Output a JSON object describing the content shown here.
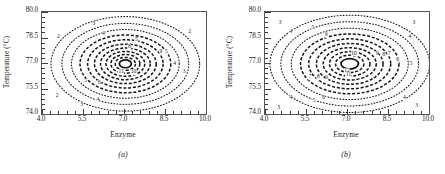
{
  "figure": {
    "panels": [
      {
        "id": "a",
        "caption": "(a)",
        "xlabel": "Enzyme",
        "ylabel": "Temperature (°C)",
        "xticks": [
          "4.0",
          "5.5",
          "7.0",
          "8.5",
          "10.0"
        ],
        "yticks": [
          "80.0",
          "78.5",
          "77.0",
          "75.5",
          "74.0"
        ]
      },
      {
        "id": "b",
        "caption": "(b)",
        "xlabel": "Enzyme",
        "ylabel": "Temperature (°C)",
        "xticks": [
          "4.0",
          "5.5",
          "7.0",
          "8.5",
          "10.0"
        ],
        "yticks": [
          "80.0",
          "78.5",
          "77.0",
          "75.5",
          "74.0"
        ]
      }
    ]
  },
  "chart_data": [
    {
      "type": "contour",
      "panel": "a",
      "title": "",
      "xlabel": "Enzyme",
      "ylabel": "Temperature (°C)",
      "xlim": [
        4.0,
        10.0
      ],
      "ylim": [
        74.0,
        80.0
      ],
      "xticks": [
        4.0,
        5.5,
        7.0,
        8.5,
        10.0
      ],
      "yticks": [
        74.0,
        75.5,
        77.0,
        78.5,
        80.0
      ],
      "grid": false,
      "legend": null,
      "minor_ticks_per_interval": 5,
      "center": {
        "x": 7.05,
        "y": 76.95
      },
      "levels": [
        2,
        3,
        4,
        5,
        6,
        7,
        8,
        9,
        10,
        11,
        12
      ],
      "contours": [
        {
          "level": 2,
          "rx": 2.72,
          "ry": 2.78,
          "style": "dotted"
        },
        {
          "level": 3,
          "rx": 2.32,
          "ry": 2.38,
          "style": "dotted"
        },
        {
          "level": 4,
          "rx": 1.97,
          "ry": 2.02,
          "style": "dotted"
        },
        {
          "level": 5,
          "rx": 1.66,
          "ry": 1.7,
          "style": "dashed"
        },
        {
          "level": 6,
          "rx": 1.38,
          "ry": 1.42,
          "style": "dashed"
        },
        {
          "level": 7,
          "rx": 1.13,
          "ry": 1.16,
          "style": "dashed"
        },
        {
          "level": 8,
          "rx": 0.91,
          "ry": 0.93,
          "style": "dashed"
        },
        {
          "level": 9,
          "rx": 0.71,
          "ry": 0.73,
          "style": "dashed"
        },
        {
          "level": 10,
          "rx": 0.53,
          "ry": 0.55,
          "style": "dashed"
        },
        {
          "level": 11,
          "rx": 0.37,
          "ry": 0.38,
          "style": "dashed"
        },
        {
          "level": 12,
          "rx": 0.22,
          "ry": 0.23,
          "style": "solid"
        }
      ],
      "labels": [
        {
          "level": 2,
          "x": 4.6,
          "y": 78.55
        },
        {
          "level": 3,
          "x": 5.9,
          "y": 79.3
        },
        {
          "level": 2,
          "x": 9.4,
          "y": 78.85
        },
        {
          "level": 3,
          "x": 9.2,
          "y": 76.45
        },
        {
          "level": 4,
          "x": 8.85,
          "y": 76.95
        },
        {
          "level": 4,
          "x": 6.25,
          "y": 78.7
        },
        {
          "level": 5,
          "x": 7.45,
          "y": 78.35
        },
        {
          "level": 2,
          "x": 4.55,
          "y": 75.05
        },
        {
          "level": 3,
          "x": 5.45,
          "y": 74.55
        },
        {
          "level": 4,
          "x": 6.05,
          "y": 74.85
        },
        {
          "level": 5,
          "x": 5.6,
          "y": 75.95
        },
        {
          "level": 6,
          "x": 6.1,
          "y": 75.85
        },
        {
          "level": 8,
          "x": 7.2,
          "y": 77.95
        },
        {
          "level": 9,
          "x": 8.35,
          "y": 77.65
        },
        {
          "level": 5,
          "x": 8.55,
          "y": 77.65
        },
        {
          "level": 11,
          "x": 6.9,
          "y": 76.45
        },
        {
          "level": 10,
          "x": 7.35,
          "y": 76.45
        }
      ]
    },
    {
      "type": "contour",
      "panel": "b",
      "title": "",
      "xlabel": "Enzyme",
      "ylabel": "Temperature (°C)",
      "xlim": [
        4.0,
        10.0
      ],
      "ylim": [
        74.0,
        80.0
      ],
      "xticks": [
        4.0,
        5.5,
        7.0,
        8.5,
        10.0
      ],
      "yticks": [
        74.0,
        75.5,
        77.0,
        78.5,
        80.0
      ],
      "grid": false,
      "legend": null,
      "minor_ticks_per_interval": 5,
      "center": {
        "x": 7.1,
        "y": 76.95
      },
      "levels": [
        3,
        4,
        5,
        6,
        7,
        8,
        9,
        10,
        11,
        12
      ],
      "contours": [
        {
          "level": 3,
          "rx": 2.92,
          "ry": 2.86,
          "style": "dotted"
        },
        {
          "level": 4,
          "rx": 2.52,
          "ry": 2.48,
          "style": "dotted"
        },
        {
          "level": 5,
          "rx": 2.14,
          "ry": 2.1,
          "style": "dotted"
        },
        {
          "level": 6,
          "rx": 1.8,
          "ry": 1.76,
          "style": "dashed"
        },
        {
          "level": 7,
          "rx": 1.5,
          "ry": 1.47,
          "style": "dashed"
        },
        {
          "level": 8,
          "rx": 1.22,
          "ry": 1.2,
          "style": "dashed"
        },
        {
          "level": 9,
          "rx": 0.97,
          "ry": 0.95,
          "style": "dashed"
        },
        {
          "level": 10,
          "rx": 0.74,
          "ry": 0.72,
          "style": "dashed"
        },
        {
          "level": 11,
          "rx": 0.52,
          "ry": 0.51,
          "style": "dashed"
        },
        {
          "level": 12,
          "rx": 0.32,
          "ry": 0.31,
          "style": "solid"
        }
      ],
      "labels": [
        {
          "level": 3,
          "x": 4.55,
          "y": 79.35
        },
        {
          "level": 4,
          "x": 4.95,
          "y": 78.85
        },
        {
          "level": 5,
          "x": 5.75,
          "y": 79.05
        },
        {
          "level": 6,
          "x": 6.25,
          "y": 78.65
        },
        {
          "level": 3,
          "x": 9.45,
          "y": 79.35
        },
        {
          "level": 4,
          "x": 9.3,
          "y": 78.55
        },
        {
          "level": 5,
          "x": 9.35,
          "y": 76.95
        },
        {
          "level": 6,
          "x": 8.85,
          "y": 77.15
        },
        {
          "level": 7,
          "x": 8.55,
          "y": 77.55
        },
        {
          "level": 9,
          "x": 8.1,
          "y": 77.55
        },
        {
          "level": 8,
          "x": 8.35,
          "y": 77.45
        },
        {
          "level": 10,
          "x": 7.25,
          "y": 77.55
        },
        {
          "level": 12,
          "x": 7.0,
          "y": 76.55
        },
        {
          "level": 11,
          "x": 7.05,
          "y": 76.3
        },
        {
          "level": 7,
          "x": 5.65,
          "y": 76.15
        },
        {
          "level": 8,
          "x": 5.95,
          "y": 76.15
        },
        {
          "level": 9,
          "x": 6.25,
          "y": 76.1
        },
        {
          "level": 6,
          "x": 6.15,
          "y": 74.95
        },
        {
          "level": 5,
          "x": 5.8,
          "y": 74.75
        },
        {
          "level": 4,
          "x": 4.95,
          "y": 74.95
        },
        {
          "level": 3,
          "x": 4.5,
          "y": 74.35
        },
        {
          "level": 4,
          "x": 9.1,
          "y": 74.95
        },
        {
          "level": 3,
          "x": 9.55,
          "y": 74.5
        }
      ]
    }
  ]
}
